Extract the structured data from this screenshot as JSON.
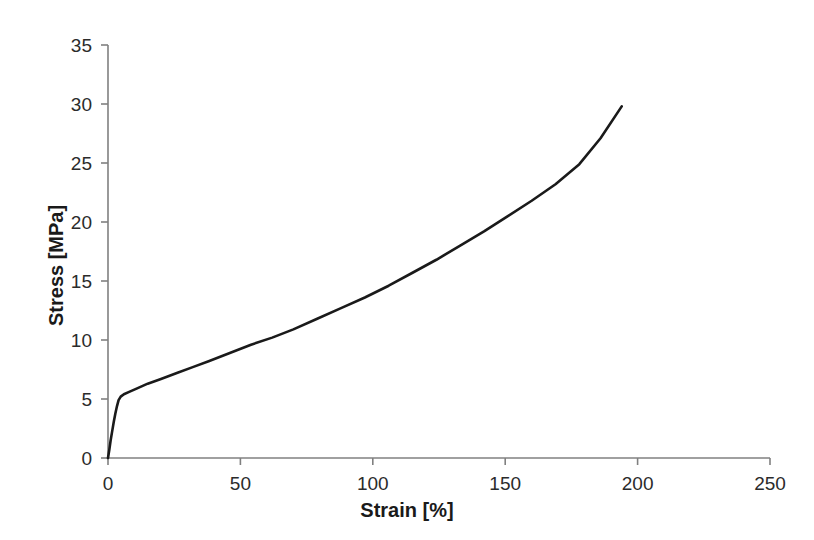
{
  "chart_data": {
    "type": "line",
    "title": "",
    "subtitle": "",
    "xlabel": "Strain [%]",
    "ylabel": "Stress [MPa]",
    "xlim": [
      0,
      250
    ],
    "ylim": [
      0,
      35
    ],
    "xticks": [
      0,
      50,
      100,
      150,
      200,
      250
    ],
    "yticks": [
      0,
      5,
      10,
      15,
      20,
      25,
      30,
      35
    ],
    "xtick_labels": [
      "0",
      "50",
      "100",
      "150",
      "200",
      "250"
    ],
    "ytick_labels": [
      "0",
      "5",
      "10",
      "15",
      "20",
      "25",
      "30",
      "35"
    ],
    "grid": false,
    "legend": null,
    "legend_position": "none",
    "series": [
      {
        "name": "Stress-strain curve",
        "color": "#1a1a1a",
        "line_width": 2.6,
        "x": [
          0,
          0.5,
          1,
          1.6,
          2.2,
          2.8,
          3.4,
          4,
          4.8,
          6,
          8,
          11,
          15,
          20,
          26,
          32,
          38,
          46,
          54,
          62,
          70,
          79,
          88,
          97,
          106,
          115,
          124,
          133,
          142,
          151,
          160,
          169,
          178,
          186,
          194
        ],
        "y": [
          0,
          0.7,
          1.5,
          2.3,
          3.1,
          3.8,
          4.4,
          4.9,
          5.2,
          5.4,
          5.6,
          5.9,
          6.3,
          6.7,
          7.2,
          7.7,
          8.2,
          8.9,
          9.6,
          10.2,
          10.9,
          11.8,
          12.7,
          13.6,
          14.6,
          15.7,
          16.8,
          18.0,
          19.2,
          20.5,
          21.8,
          23.2,
          24.9,
          27.1,
          29.8
        ]
      }
    ],
    "annotations": [],
    "axis_color": "#808080",
    "background": "#ffffff"
  },
  "plot_geometry": {
    "x_origin_px": 108,
    "y_origin_px": 458,
    "x_end_px": 770,
    "y_top_px": 45
  }
}
